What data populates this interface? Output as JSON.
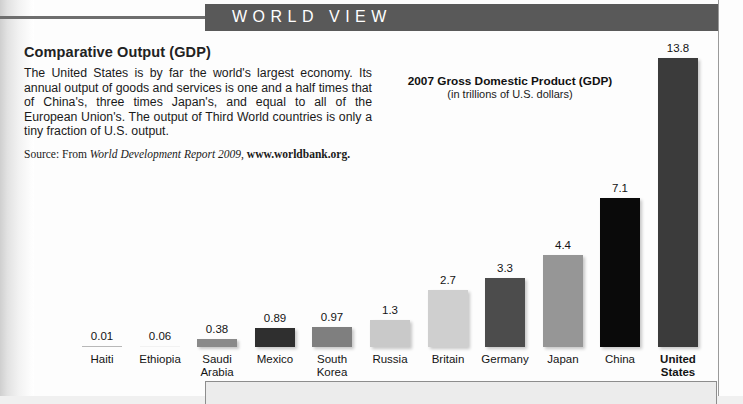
{
  "header": {
    "band_title": "WORLD VIEW",
    "band_color": "#595959"
  },
  "article": {
    "headline": "Comparative Output (GDP)",
    "body": "The United States is by far the world's largest economy. Its annual output of goods and services is one and a half times that of China's, three times Japan's, and equal to all of the European Union's. The output of Third World countries is only a tiny fraction of U.S. output.",
    "source": {
      "prefix": "Source: From ",
      "title_italic": "World Development Report 2009",
      "separator": ", ",
      "url_bold": "www.worldbank.org."
    }
  },
  "chart_data": {
    "type": "bar",
    "title": "2007 Gross Domestic Product (GDP)",
    "subtitle": "(in trillions of U.S. dollars)",
    "xlabel": "",
    "ylabel": "Trillions of U.S. dollars",
    "ylim": [
      0,
      13.8
    ],
    "grid": false,
    "legend": "none",
    "categories": [
      "Haiti",
      "Ethiopia",
      "Saudi Arabia",
      "Mexico",
      "South Korea",
      "Russia",
      "Britain",
      "Germany",
      "Japan",
      "China",
      "United States"
    ],
    "values": [
      0.01,
      0.06,
      0.38,
      0.89,
      0.97,
      1.3,
      2.7,
      3.3,
      4.4,
      7.1,
      13.8
    ],
    "value_labels": [
      "0.01",
      "0.06",
      "0.38",
      "0.89",
      "0.97",
      "1.3",
      "2.7",
      "3.3",
      "4.4",
      "7.1",
      "13.8"
    ],
    "bar_colors": [
      "#b8b8b8",
      "#f2f2f2",
      "#8a8a8a",
      "#2f2f2f",
      "#7f7f7f",
      "#c9c9c9",
      "#cfcfcf",
      "#4c4c4c",
      "#969696",
      "#0a0a0a",
      "#3b3b3b"
    ],
    "highlighted_category": "United States"
  }
}
